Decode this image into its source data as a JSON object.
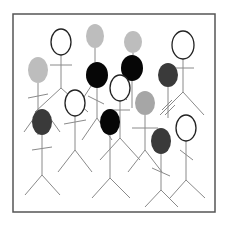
{
  "figure": {
    "frame": {
      "x": 13,
      "y": 14,
      "width": 202,
      "height": 198,
      "stroke": "#555555"
    },
    "colors": {
      "white": "#ffffff",
      "light": "#bdbdbd",
      "medium": "#a6a6a6",
      "dark": "#3a3a3a",
      "black": "#060606",
      "line": "#8a8a8a",
      "outline": "#222222"
    },
    "people": [
      {
        "id": "p1",
        "head": "white",
        "cx": 61,
        "cy": 42,
        "rx": 10,
        "ry": 13
      },
      {
        "id": "p2",
        "head": "light",
        "cx": 95,
        "cy": 36,
        "rx": 9,
        "ry": 12
      },
      {
        "id": "p3",
        "head": "light",
        "cx": 38,
        "cy": 70,
        "rx": 10,
        "ry": 13
      },
      {
        "id": "p4",
        "head": "black",
        "cx": 97,
        "cy": 75,
        "rx": 11,
        "ry": 13
      },
      {
        "id": "p5",
        "head": "light",
        "cx": 133,
        "cy": 42,
        "rx": 9,
        "ry": 11
      },
      {
        "id": "p6",
        "head": "black",
        "cx": 132,
        "cy": 68,
        "rx": 11,
        "ry": 13
      },
      {
        "id": "p7",
        "head": "white",
        "cx": 183,
        "cy": 45,
        "rx": 11,
        "ry": 14
      },
      {
        "id": "p8",
        "head": "dark",
        "cx": 168,
        "cy": 75,
        "rx": 10,
        "ry": 12
      },
      {
        "id": "p9",
        "head": "white",
        "cx": 75,
        "cy": 103,
        "rx": 10,
        "ry": 13
      },
      {
        "id": "p10",
        "head": "white",
        "cx": 120,
        "cy": 88,
        "rx": 10,
        "ry": 13
      },
      {
        "id": "p11",
        "head": "medium",
        "cx": 145,
        "cy": 103,
        "rx": 10,
        "ry": 12
      },
      {
        "id": "p12",
        "head": "dark",
        "cx": 42,
        "cy": 122,
        "rx": 10,
        "ry": 13
      },
      {
        "id": "p13",
        "head": "black",
        "cx": 110,
        "cy": 122,
        "rx": 10,
        "ry": 13
      },
      {
        "id": "p14",
        "head": "white",
        "cx": 186,
        "cy": 128,
        "rx": 10,
        "ry": 13
      },
      {
        "id": "p15",
        "head": "dark",
        "cx": 161,
        "cy": 141,
        "rx": 10,
        "ry": 13
      }
    ],
    "lines": [
      [
        61,
        55,
        61,
        88
      ],
      [
        50,
        65,
        72,
        65
      ],
      [
        61,
        88,
        35,
        112
      ],
      [
        61,
        88,
        88,
        112
      ],
      [
        95,
        48,
        95,
        62
      ],
      [
        38,
        83,
        38,
        135
      ],
      [
        28,
        98,
        48,
        94
      ],
      [
        97,
        88,
        97,
        118
      ],
      [
        88,
        96,
        104,
        104
      ],
      [
        97,
        118,
        82,
        140
      ],
      [
        97,
        118,
        112,
        140
      ],
      [
        133,
        53,
        133,
        55
      ],
      [
        132,
        81,
        132,
        108
      ],
      [
        183,
        59,
        183,
        92
      ],
      [
        172,
        68,
        194,
        68
      ],
      [
        183,
        92,
        160,
        115
      ],
      [
        183,
        92,
        204,
        115
      ],
      [
        168,
        87,
        168,
        118
      ],
      [
        162,
        110,
        172,
        100
      ],
      [
        165,
        115,
        175,
        105
      ],
      [
        75,
        116,
        75,
        150
      ],
      [
        64,
        124,
        86,
        120
      ],
      [
        75,
        150,
        58,
        172
      ],
      [
        75,
        150,
        92,
        172
      ],
      [
        120,
        101,
        120,
        138
      ],
      [
        110,
        110,
        130,
        110
      ],
      [
        120,
        138,
        100,
        160
      ],
      [
        120,
        138,
        140,
        160
      ],
      [
        145,
        115,
        145,
        150
      ],
      [
        132,
        128,
        158,
        128
      ],
      [
        145,
        150,
        128,
        172
      ],
      [
        145,
        150,
        162,
        172
      ],
      [
        42,
        135,
        42,
        175
      ],
      [
        32,
        150,
        52,
        147
      ],
      [
        42,
        175,
        25,
        195
      ],
      [
        42,
        175,
        60,
        195
      ],
      [
        34,
        118,
        24,
        132
      ],
      [
        50,
        118,
        60,
        132
      ],
      [
        110,
        135,
        110,
        178
      ],
      [
        110,
        178,
        92,
        198
      ],
      [
        110,
        178,
        130,
        198
      ],
      [
        186,
        141,
        186,
        180
      ],
      [
        180,
        150,
        193,
        160
      ],
      [
        186,
        180,
        170,
        198
      ],
      [
        186,
        180,
        205,
        198
      ],
      [
        161,
        154,
        161,
        190
      ],
      [
        152,
        168,
        170,
        176
      ],
      [
        161,
        190,
        145,
        207
      ],
      [
        161,
        190,
        178,
        207
      ],
      [
        82,
        100,
        95,
        80
      ],
      [
        112,
        85,
        127,
        100
      ]
    ]
  }
}
